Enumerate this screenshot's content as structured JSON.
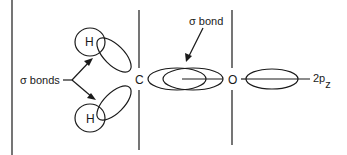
{
  "diagram": {
    "type": "molecular-orbital-diagram",
    "atoms": {
      "h_top": "H",
      "h_bottom": "H",
      "carbon": "C",
      "oxygen": "O"
    },
    "labels": {
      "sigma_bonds": "σ bonds",
      "sigma_bond": "σ bond",
      "orbital_2p": "2p",
      "orbital_2p_sub": "z"
    },
    "colors": {
      "stroke": "#1a1a1a",
      "background": "#ffffff"
    }
  }
}
